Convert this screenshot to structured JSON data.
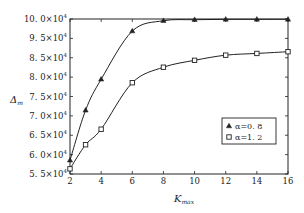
{
  "chart_data": {
    "type": "line",
    "title": "",
    "xlabel": "K_max",
    "ylabel": "Δ_m",
    "x": [
      2,
      3,
      4,
      6,
      8,
      10,
      12,
      14,
      16
    ],
    "xticks": [
      2,
      4,
      6,
      8,
      10,
      12,
      14,
      16
    ],
    "xlim": [
      2,
      16
    ],
    "ylim": [
      55000,
      100000
    ],
    "yticks_labels": [
      "10.0×10⁴",
      "9.5×10⁴",
      "8.5×10⁴",
      "8.0×10⁴",
      "7.5×10⁴",
      "7.0×10⁴",
      "6.5×10⁴",
      "6.0×10⁴",
      "5.5×10⁴"
    ],
    "grid": false,
    "legend_position": "center-right",
    "series": [
      {
        "name": "α=0.8",
        "marker": "triangle",
        "values": [
          59000,
          73500,
          82500,
          96500,
          99500,
          99800,
          99900,
          99900,
          99900
        ]
      },
      {
        "name": "α=1.2",
        "marker": "square",
        "values": [
          56500,
          63500,
          68000,
          81500,
          86000,
          88000,
          89500,
          90000,
          90500
        ]
      }
    ]
  },
  "labels": {
    "xlabel_main": "K",
    "xlabel_sub": "max",
    "ylabel_main": "Δ",
    "ylabel_sub": "m",
    "legend": [
      "α=0.8",
      "α=1.2"
    ]
  }
}
